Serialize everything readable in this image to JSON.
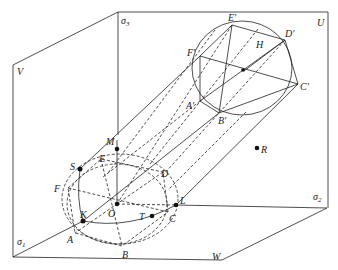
{
  "diagram": {
    "planes": [
      {
        "id": "V",
        "label": "V"
      },
      {
        "id": "U",
        "label": "U"
      },
      {
        "id": "W",
        "label": "W"
      }
    ],
    "axes": [
      {
        "id": "sigma1",
        "symbol": "σ",
        "sub": "1"
      },
      {
        "id": "sigma2",
        "symbol": "σ",
        "sub": "2"
      },
      {
        "id": "sigma3",
        "symbol": "σ",
        "sub": "3"
      }
    ],
    "lower_circle_points": {
      "A": "A",
      "B": "B",
      "C": "C",
      "D": "D",
      "E": "E",
      "F": "F",
      "O": "O",
      "K": "K",
      "T": "T",
      "L": "L",
      "S": "S",
      "M": "M",
      "R": "R"
    },
    "upper_hexagon_points": {
      "A": "A′",
      "B": "B′",
      "C": "C′",
      "D": "D′",
      "E": "E′",
      "F": "F′",
      "H": "H"
    },
    "colors": {
      "line": "#222222",
      "background": "#ffffff"
    }
  }
}
